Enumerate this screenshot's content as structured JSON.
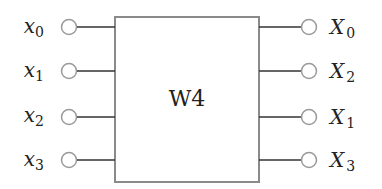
{
  "block": {
    "label": "W4"
  },
  "inputs": [
    {
      "var": "x",
      "sub": "0"
    },
    {
      "var": "x",
      "sub": "1"
    },
    {
      "var": "x",
      "sub": "2"
    },
    {
      "var": "x",
      "sub": "3"
    }
  ],
  "outputs": [
    {
      "var": "X",
      "sub": "0"
    },
    {
      "var": "X",
      "sub": "2"
    },
    {
      "var": "X",
      "sub": "1"
    },
    {
      "var": "X",
      "sub": "3"
    }
  ],
  "colors": {
    "box": "#8a8a8a",
    "circle": "#9a9a9a",
    "wire": "#333333",
    "text": "#222222"
  }
}
